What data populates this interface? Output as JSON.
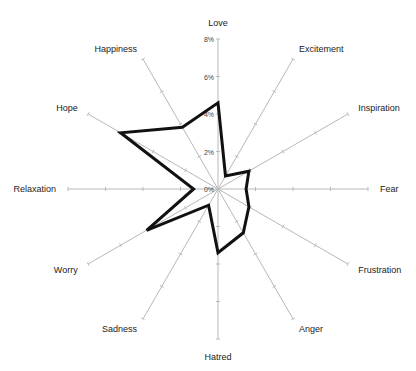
{
  "chart_data": {
    "type": "radar",
    "title": "",
    "categories": [
      "Love",
      "Excitement",
      "Inspiration",
      "Fear",
      "Frustration",
      "Anger",
      "Hatred",
      "Sadness",
      "Worry",
      "Relaxation",
      "Hope",
      "Happiness"
    ],
    "series": [
      {
        "name": "Series 1",
        "values": [
          4.6,
          0.8,
          1.9,
          1.5,
          1.9,
          2.7,
          3.4,
          1.0,
          4.4,
          1.3,
          6.0,
          3.8
        ],
        "color": "#111111"
      }
    ],
    "radial_axis": {
      "min": 0,
      "max": 8,
      "step": 2,
      "unit": "%",
      "tick_labels": [
        "0%",
        "2%",
        "4%",
        "6%",
        "8%"
      ]
    },
    "legend": "none",
    "grid": false
  },
  "layout": {
    "cx": 218,
    "cy": 189,
    "radius": 150
  }
}
